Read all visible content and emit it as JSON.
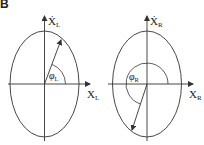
{
  "figure": {
    "panel_label": "B",
    "left": {
      "y_axis_label": "Ẋ",
      "y_axis_sub": "L",
      "x_axis_label": "X",
      "x_axis_sub": "L",
      "angle_label": "φ",
      "angle_sub": "L"
    },
    "right": {
      "y_axis_label": "Ẋ",
      "y_axis_sub": "R",
      "x_axis_label": "X",
      "x_axis_sub": "R",
      "angle_label": "φ",
      "angle_sub": "R"
    },
    "colors": {
      "stroke": "#333333",
      "background": "#ffffff"
    }
  }
}
